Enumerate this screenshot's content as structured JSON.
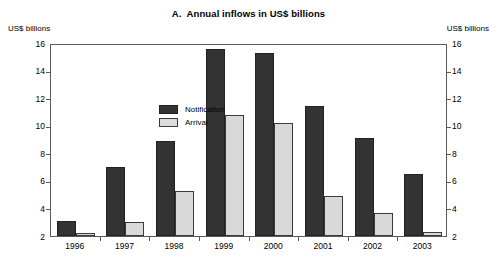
{
  "chart_data": {
    "type": "bar",
    "title": "A.  Annual inflows in US$ billions",
    "xlabel": "",
    "ylabel": "US$ billions",
    "ylabel_right": "US$ billions",
    "categories": [
      "1996",
      "1997",
      "1998",
      "1999",
      "2000",
      "2001",
      "2002",
      "2003"
    ],
    "series": [
      {
        "name": "Notification",
        "color": "#333333",
        "values": [
          3.1,
          7.0,
          8.9,
          15.6,
          15.3,
          11.4,
          9.1,
          6.5
        ]
      },
      {
        "name": "Arrival",
        "color": "#d9d9d9",
        "values": [
          2.2,
          3.0,
          5.3,
          10.8,
          10.2,
          4.9,
          3.7,
          2.3
        ]
      }
    ],
    "ylim": [
      2,
      16
    ],
    "yticks": [
      2,
      4,
      6,
      8,
      10,
      12,
      14,
      16
    ],
    "ytick_labels": [
      "2",
      "4",
      "6",
      "8",
      "10",
      "12",
      "14",
      "16"
    ],
    "grid": false,
    "legend_position": "inside-top-left",
    "axis_baseline_note": "bars are drawn from the y=2 axis floor"
  }
}
